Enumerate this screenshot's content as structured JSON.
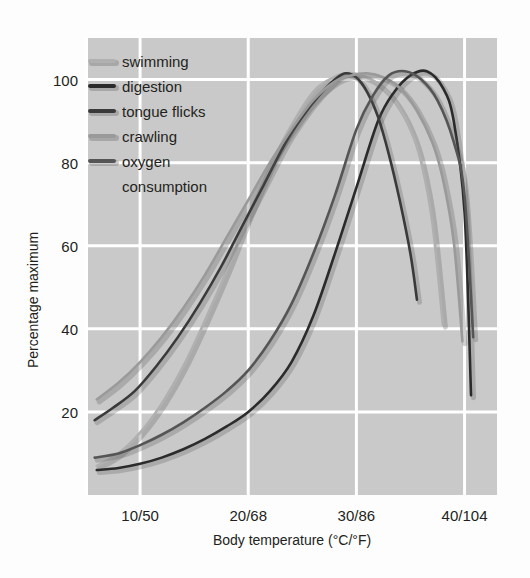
{
  "chart_data": {
    "type": "line",
    "title": "",
    "xlabel": "Body temperature (°C/°F)",
    "ylabel": "Percentage maximum",
    "xtick_labels": [
      "10/50",
      "20/68",
      "30/86",
      "40/104"
    ],
    "xtick_values": [
      10,
      20,
      30,
      40
    ],
    "ytick_labels": [
      "20",
      "40",
      "60",
      "80",
      "100"
    ],
    "ytick_values": [
      20,
      40,
      60,
      80,
      100
    ],
    "xlim": [
      5,
      43
    ],
    "ylim": [
      0,
      110
    ],
    "grid": true,
    "grid_color": "#ffffff",
    "plot_background": "#c9c9c9",
    "legend_position": "top-left",
    "series": [
      {
        "name": "swimming",
        "color": "#b0b0b0",
        "x": [
          6.0,
          8.0,
          10.0,
          12.0,
          14.0,
          16.0,
          18.0,
          20.0,
          22.0,
          24.0,
          26.0,
          27.5,
          29.0,
          30.5,
          32.0,
          33.5,
          35.0,
          36.0,
          37.0,
          38.0
        ],
        "values": [
          7.0,
          10.0,
          15.0,
          22.0,
          31.0,
          42.0,
          54.0,
          67.0,
          79.0,
          89.0,
          97.0,
          100.0,
          101.5,
          101.0,
          99.0,
          95.0,
          88.0,
          80.0,
          66.0,
          41.0
        ]
      },
      {
        "name": "digestion",
        "color": "#2b2b2b",
        "x": [
          6.0,
          8.0,
          10.0,
          12.0,
          14.0,
          16.0,
          18.0,
          20.0,
          22.0,
          24.0,
          26.0,
          28.0,
          30.0,
          32.0,
          33.5,
          35.0,
          36.5,
          38.0,
          39.0,
          40.0,
          40.6
        ],
        "values": [
          6.0,
          6.5,
          7.5,
          9.0,
          11.0,
          13.5,
          16.5,
          20.0,
          25.0,
          32.0,
          43.0,
          58.0,
          74.0,
          90.0,
          97.0,
          101.0,
          102.0,
          98.0,
          90.0,
          68.0,
          24.0
        ]
      },
      {
        "name": "tongue flicks",
        "color": "#3a3a3a",
        "x": [
          5.8,
          7.5,
          9.5,
          11.5,
          13.5,
          15.5,
          17.5,
          19.5,
          21.5,
          23.5,
          25.0,
          26.5,
          28.0,
          29.0,
          30.0,
          31.0,
          32.0,
          33.0,
          34.0,
          35.0,
          35.6
        ],
        "values": [
          18.0,
          21.0,
          25.0,
          31.0,
          38.0,
          46.0,
          55.0,
          65.0,
          75.0,
          85.0,
          91.0,
          96.0,
          100.0,
          101.5,
          100.5,
          97.0,
          91.0,
          82.0,
          71.0,
          58.0,
          47.0
        ]
      },
      {
        "name": "crawling",
        "color": "#9a9a9a",
        "x": [
          6.0,
          8.0,
          10.0,
          12.0,
          14.0,
          16.0,
          18.0,
          20.0,
          22.0,
          24.0,
          26.0,
          28.0,
          29.5,
          31.0,
          32.5,
          34.0,
          35.5,
          37.0,
          38.0,
          39.0,
          39.8
        ],
        "values": [
          23.0,
          27.0,
          32.0,
          38.0,
          45.0,
          53.0,
          62.0,
          71.0,
          80.0,
          88.0,
          95.0,
          99.5,
          101.0,
          101.5,
          100.5,
          98.0,
          93.0,
          85.0,
          76.0,
          61.0,
          37.0
        ]
      },
      {
        "name": "oxygen consumption",
        "color": "#555555",
        "x": [
          5.8,
          8.0,
          10.0,
          12.0,
          14.0,
          16.0,
          18.0,
          20.0,
          22.0,
          24.0,
          26.0,
          28.0,
          30.0,
          31.5,
          33.0,
          34.5,
          36.0,
          37.5,
          39.0,
          40.0,
          40.8
        ],
        "values": [
          9.0,
          10.0,
          12.0,
          14.5,
          17.5,
          21.0,
          25.0,
          30.0,
          37.0,
          46.0,
          58.0,
          72.0,
          88.0,
          96.0,
          101.0,
          102.0,
          100.0,
          95.0,
          85.0,
          72.0,
          38.0
        ]
      }
    ],
    "legend_entries": [
      {
        "label": "swimming",
        "color": "#b0b0b0"
      },
      {
        "label": "digestion",
        "color": "#2b2b2b"
      },
      {
        "label": "tongue flicks",
        "color": "#3a3a3a"
      },
      {
        "label": "crawling",
        "color": "#9a9a9a"
      },
      {
        "label": "oxygen",
        "color": "#555555"
      },
      {
        "label": "consumption",
        "color": null
      }
    ]
  }
}
